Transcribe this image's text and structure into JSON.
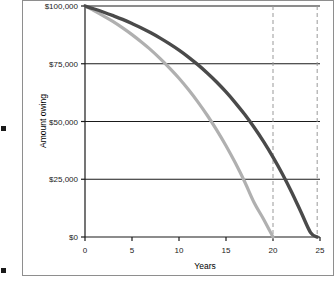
{
  "figure": {
    "background_color": "#ffffff",
    "frame_color": "#8e8e8e"
  },
  "margin_text": {
    "fragments": [
      "e",
      "n",
      "l",
      "k",
      "r",
      "e",
      "u",
      "e",
      "."
    ],
    "bullet_glyph": "square-bullet"
  },
  "chart_data": {
    "type": "line",
    "title": "",
    "xlabel": "Years",
    "ylabel": "Amount owing",
    "xlim": [
      0,
      25
    ],
    "ylim": [
      0,
      100000
    ],
    "xticks": [
      0,
      5,
      10,
      15,
      20,
      25
    ],
    "xtick_labels": [
      "0",
      "5",
      "10",
      "15",
      "20",
      "25"
    ],
    "yticks": [
      0,
      25000,
      50000,
      75000,
      100000
    ],
    "ytick_labels": [
      "$0",
      "$25,000",
      "$50,000",
      "$75,000",
      "$100,000"
    ],
    "grid": "horizontal-solid-black",
    "legend": "none",
    "series": [
      {
        "name": "shorter-term-loan",
        "color": "#b0b0b0",
        "linewidth": 3.2,
        "payoff_year": 20,
        "x": [
          0,
          1,
          2,
          3,
          4,
          5,
          6,
          7,
          8,
          9,
          10,
          11,
          12,
          13,
          14,
          15,
          16,
          17,
          18,
          19,
          20
        ],
        "y": [
          100000,
          97900,
          95600,
          93200,
          90500,
          87600,
          84400,
          81000,
          77200,
          73100,
          68700,
          63800,
          58500,
          52700,
          46400,
          39500,
          32000,
          23800,
          14800,
          7700,
          0
        ]
      },
      {
        "name": "longer-term-loan",
        "color": "#4a4a4a",
        "linewidth": 3.4,
        "payoff_year": 24.7,
        "x": [
          0,
          1,
          2,
          3,
          4,
          5,
          6,
          7,
          8,
          9,
          10,
          11,
          12,
          13,
          14,
          15,
          16,
          17,
          18,
          19,
          20,
          21,
          22,
          23,
          24,
          24.7
        ],
        "y": [
          100000,
          98700,
          97300,
          95800,
          94200,
          92400,
          90500,
          88400,
          86100,
          83600,
          80900,
          77900,
          74600,
          71000,
          67100,
          62800,
          58100,
          53000,
          47400,
          41300,
          34600,
          27300,
          19300,
          10600,
          1900,
          0
        ]
      }
    ],
    "vlines": [
      {
        "name": "payoff-marker-20",
        "x": 20,
        "color": "#999999",
        "style": "dashed"
      },
      {
        "name": "payoff-marker-25",
        "x": 24.7,
        "color": "#999999",
        "style": "dashed"
      }
    ]
  }
}
